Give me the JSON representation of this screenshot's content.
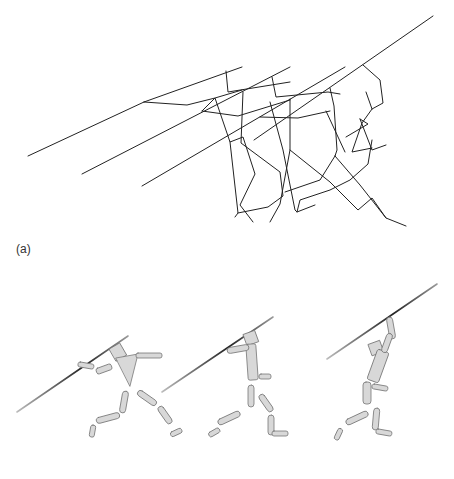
{
  "figure": {
    "panels": [
      {
        "id": "a",
        "label": "(a)",
        "description": "Stick-figure line drawings of three javelin-throw poses overlaid, each holding a javelin"
      },
      {
        "id": "b",
        "label": "(b)",
        "description": "Rendered 3D cylinder-segment mannequin in three javelin-throw poses"
      }
    ]
  },
  "colors": {
    "line": "#222222",
    "limb_fill": "#d6d6d6",
    "limb_stroke": "#888888",
    "javelin_dark": "#333333",
    "javelin_light": "#aaaaaa"
  }
}
